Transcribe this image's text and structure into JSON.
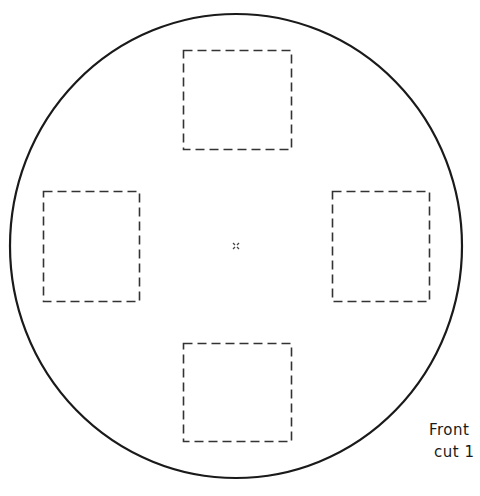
{
  "diagram": {
    "kind": "template",
    "shape": "circle",
    "stroke_color": "#1a1a1a",
    "cutouts": [
      {
        "id": "top",
        "position": "top"
      },
      {
        "id": "left",
        "position": "left"
      },
      {
        "id": "right",
        "position": "right"
      },
      {
        "id": "bottom",
        "position": "bottom"
      }
    ],
    "center_mark": "x",
    "labels": {
      "line1": "Front",
      "line2": "cut 1"
    }
  }
}
